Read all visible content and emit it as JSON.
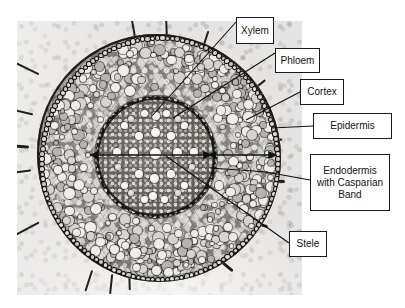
{
  "figure": {
    "kind": "root-cross-section-micrograph",
    "specimen": "plant root transverse section",
    "plate_background_color": "#e6e4e2",
    "label_box_border_color": "#1a1a1a",
    "label_box_fill_color": "#ffffff",
    "text_color": "#111111"
  },
  "labels": [
    {
      "id": "xylem",
      "text": "Xylem"
    },
    {
      "id": "phloem",
      "text": "Phloem"
    },
    {
      "id": "cortex",
      "text": "Cortex"
    },
    {
      "id": "epidermis",
      "text": "Epidermis"
    },
    {
      "id": "endodermis",
      "text": "Endodermis\nwith Casparian\nBand"
    },
    {
      "id": "stele",
      "text": "Stele"
    }
  ],
  "annotations": {
    "leader_lines": [
      {
        "for": "xylem",
        "type": "line",
        "from": [
          236,
          22
        ],
        "to": [
          152,
          116
        ]
      },
      {
        "for": "phloem",
        "type": "line",
        "from": [
          275,
          53
        ],
        "to": [
          173,
          118
        ]
      },
      {
        "for": "cortex",
        "type": "double-arrow",
        "from": [
          213,
          155
        ],
        "to": [
          277,
          155
        ]
      },
      {
        "for": "epidermis",
        "type": "line",
        "from": [
          313,
          126
        ],
        "to": [
          272,
          126
        ]
      },
      {
        "for": "endodermis",
        "type": "line",
        "from": [
          310,
          182
        ],
        "to": [
          208,
          168
        ]
      },
      {
        "for": "stele",
        "type": "double-arrow",
        "from": [
          96,
          155
        ],
        "to": [
          212,
          155
        ]
      },
      {
        "for": "stele",
        "type": "line",
        "from": [
          289,
          243
        ],
        "to": [
          166,
          156
        ]
      }
    ]
  },
  "structures": [
    {
      "name": "epidermis",
      "description": "outer beaded cell ring with root hairs"
    },
    {
      "name": "cortex",
      "description": "broad zone of large light parenchyma cells"
    },
    {
      "name": "endodermis",
      "description": "dark ring bounding the stele, Casparian band"
    },
    {
      "name": "stele",
      "description": "central vascular cylinder"
    },
    {
      "name": "xylem",
      "description": "large white vessels in radial arms"
    },
    {
      "name": "phloem",
      "description": "cell groups between the xylem arms"
    }
  ]
}
